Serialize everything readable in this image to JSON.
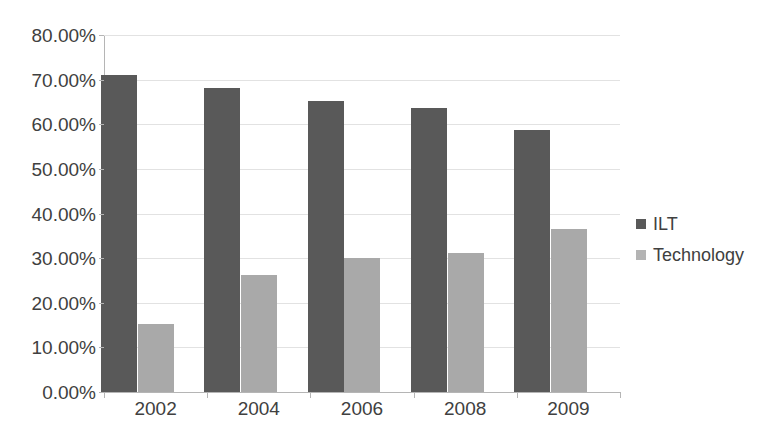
{
  "chart_data": {
    "type": "bar",
    "title": "",
    "title_cropped": true,
    "xlabel": "",
    "ylabel": "",
    "categories": [
      "2002",
      "2004",
      "2006",
      "2008",
      "2009"
    ],
    "series": [
      {
        "name": "ILT",
        "color": "#595959",
        "values": [
          71.0,
          68.1,
          65.3,
          63.6,
          58.7
        ]
      },
      {
        "name": "Technology",
        "color": "#a9a9a9",
        "values": [
          15.3,
          26.2,
          30.0,
          31.1,
          36.5
        ]
      }
    ],
    "ylim": [
      0,
      80
    ],
    "ytick_step": 10,
    "ytick_labels": [
      "80.00%",
      "70.00%",
      "60.00%",
      "50.00%",
      "40.00%",
      "30.00%",
      "20.00%",
      "10.00%",
      "0.00%"
    ],
    "ytick_values": [
      80,
      70,
      60,
      50,
      40,
      30,
      20,
      10,
      0
    ],
    "grid": true,
    "grid_axis": "y",
    "legend_position": "right",
    "value_format": "percent"
  },
  "legend": {
    "entries": [
      {
        "label": "ILT",
        "color": "#595959"
      },
      {
        "label": "Technology",
        "color": "#b4b4b4"
      }
    ]
  },
  "axis": {
    "y_labels": [
      "80.00%",
      "70.00%",
      "60.00%",
      "50.00%",
      "40.00%",
      "30.00%",
      "20.00%",
      "10.00%",
      "0.00%"
    ],
    "x_labels": [
      "2002",
      "2004",
      "2006",
      "2008",
      "2009"
    ]
  }
}
